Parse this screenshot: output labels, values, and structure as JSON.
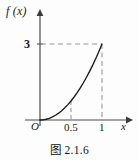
{
  "figure": {
    "caption": "图 2.1.6",
    "y_axis_label": "f (x)",
    "x_axis_label": "x",
    "origin_label": "O",
    "y_tick_label": "3",
    "x_tick_labels": [
      "0.5",
      "1"
    ],
    "curve_color": "#1a1a1a",
    "axis_color": "#4d4d4d",
    "dashed_color": "#9a9a9a",
    "background_color": "#fdfdfd"
  },
  "chart_data": {
    "type": "line",
    "title": "图 2.1.6",
    "xlabel": "x",
    "ylabel": "f (x)",
    "xlim": [
      0,
      1.12
    ],
    "ylim": [
      0,
      3.45
    ],
    "grid": false,
    "legend": null,
    "x_ticks": [
      0.5,
      1
    ],
    "x_tick_labels": [
      "0.5",
      "1"
    ],
    "y_ticks": [
      3
    ],
    "y_tick_labels": [
      "3"
    ],
    "origin_label": "O",
    "series": [
      {
        "name": "f(x) = 3x^2",
        "x": [
          0,
          0.05,
          0.1,
          0.15,
          0.2,
          0.25,
          0.3,
          0.35,
          0.4,
          0.45,
          0.5,
          0.55,
          0.6,
          0.65,
          0.7,
          0.75,
          0.8,
          0.85,
          0.9,
          0.95,
          1
        ],
        "y": [
          0,
          0.0075,
          0.03,
          0.0675,
          0.12,
          0.1875,
          0.27,
          0.3675,
          0.48,
          0.6075,
          0.75,
          0.9075,
          1.08,
          1.2675,
          1.47,
          1.6875,
          1.92,
          2.1675,
          2.43,
          2.7075,
          3
        ]
      }
    ],
    "annotations": [
      {
        "type": "dashed-horizontal",
        "y": 3,
        "from_x": 0,
        "to_x": 1
      },
      {
        "type": "dashed-vertical",
        "x": 1,
        "from_y": 0,
        "to_y": 3
      },
      {
        "type": "dashed-vertical",
        "x": 0.5,
        "from_y": 0,
        "to_y": 0.75
      }
    ]
  }
}
